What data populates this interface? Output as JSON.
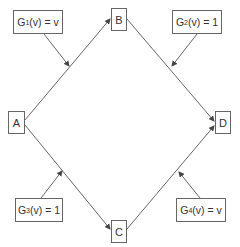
{
  "nodes": {
    "A": {
      "label": "A"
    },
    "B": {
      "label": "B"
    },
    "C": {
      "label": "C"
    },
    "D": {
      "label": "D"
    }
  },
  "functions": [
    {
      "id": "G1",
      "prefix": "G",
      "sub": "1",
      "suffix": "(v) = v",
      "edge": "A-B"
    },
    {
      "id": "G2",
      "prefix": "G",
      "sub": "2",
      "suffix": "(v) = 1",
      "edge": "B-D"
    },
    {
      "id": "G3",
      "prefix": "G",
      "sub": "3",
      "suffix": "(v) = 1",
      "edge": "A-C"
    },
    {
      "id": "G4",
      "prefix": "G",
      "sub": "4",
      "suffix": "(v) = v",
      "edge": "C-D"
    }
  ],
  "edges": [
    {
      "from": "A",
      "to": "B"
    },
    {
      "from": "B",
      "to": "D"
    },
    {
      "from": "A",
      "to": "C"
    },
    {
      "from": "C",
      "to": "D"
    }
  ],
  "colors": {
    "line": "#555555",
    "border": "#666666",
    "text": "#333333"
  }
}
